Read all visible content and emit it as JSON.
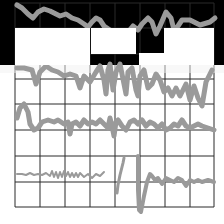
{
  "canvas": {
    "width": 224,
    "height": 224,
    "background": "#ffffff"
  },
  "colors": {
    "grid": "#2a2a2a",
    "signal": "#9a9a9a",
    "black_region": "#000000",
    "white_block": "#ffffff"
  },
  "grid": {
    "x_lines": [
      15,
      40,
      65,
      90,
      115,
      140,
      165,
      190,
      214
    ],
    "y_lines": [
      3,
      28,
      54,
      79,
      104,
      130,
      156,
      182,
      207
    ]
  },
  "black_region": {
    "x": 0,
    "y": 0,
    "w": 224,
    "h": 65
  },
  "white_blocks": [
    {
      "x": 15,
      "y": 28,
      "w": 75,
      "h": 37
    },
    {
      "x": 91,
      "y": 28,
      "w": 45,
      "h": 26
    },
    {
      "x": 139,
      "y": 53,
      "w": 25,
      "h": 12
    },
    {
      "x": 164,
      "y": 28,
      "w": 50,
      "h": 37
    }
  ],
  "fade_band": {
    "x": 0,
    "y": 65,
    "w": 224,
    "h": 8
  },
  "signals": [
    {
      "name": "trace-1",
      "width": 5,
      "points": "17,5 22,8 28,14 33,18 38,12 44,9 50,11 56,14 60,16 66,14 72,18 78,20 84,24 88,27 92,22 96,18 100,20 104,26 110,30 116,34 122,36 128,32 133,26 138,30 142,24 148,18 152,22 156,34 160,26 166,12 171,18 174,30 178,26 182,20 190,20 200,25 210,22 215,18"
    },
    {
      "name": "trace-2",
      "width": 5,
      "points": "17,68 24,68 32,70 36,84 40,72 46,66 52,70 58,72 64,76 70,74 76,76 80,88 84,76 90,82 96,72 100,66 104,80 106,94 108,70 110,64 113,90 116,72 120,64 124,84 126,94 128,72 132,68 136,90 138,96 140,76 144,70 148,88 152,84 156,74 160,80 164,92 168,88 172,96 176,88 180,96 186,84 190,100 194,86 198,98 202,106 206,82 212,70"
    },
    {
      "name": "trace-3",
      "width": 5,
      "points": "17,118 20,108 24,104 28,112 30,124 34,130 38,128 42,122 48,120 54,122 58,120 64,124 68,122 70,134 72,124 76,122 80,126 84,120 88,124 92,122 96,124 100,120 104,124 108,128 110,118 112,126 114,136 116,122 118,120 122,126 126,130 130,122 134,120 138,124 142,120 146,126 150,122 154,124 158,128 162,124 166,130 170,128 174,124 178,126 182,120 186,126 190,128 194,126 198,124 202,126 208,128 214,130"
    },
    {
      "name": "trace-4",
      "width": 2,
      "points": "17,174 22,174 26,175 30,173 34,175 38,174 42,175 46,173 50,176 52,171 54,177 56,172 58,178 60,172 62,177 64,171 66,176 68,172 70,177 72,173 74,177 76,173 78,177 80,173 84,177 88,174 92,178 96,174 100,176 104,172"
    },
    {
      "name": "trace-5",
      "width": 3,
      "points": "117,193 118,185 120,175 123,163 124,158"
    },
    {
      "name": "trace-6",
      "width": 4,
      "points": "138,156 138,170 138,190 139,210 141,212 144,196 147,182 150,174 152,176 155,180 158,178 162,184 166,178 170,180 174,182 178,178 182,180 186,186 190,180 194,182 198,180 202,182 208,180 214,182"
    }
  ]
}
